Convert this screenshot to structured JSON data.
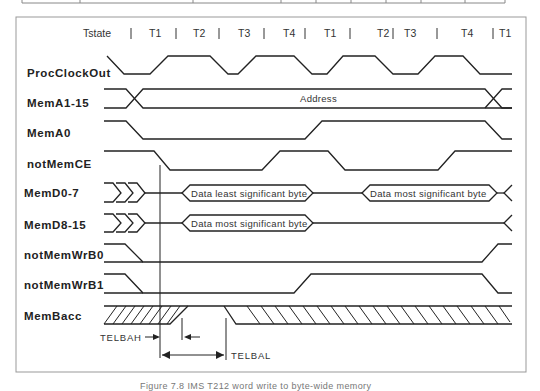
{
  "figure": {
    "caption": "Figure 7.8 IMS T212 word write to byte-wide memory"
  },
  "tstate": {
    "label": "Tstate",
    "states": [
      "T1",
      "T2",
      "T3",
      "T4",
      "T1",
      "T2",
      "T3",
      "T4",
      "T1"
    ]
  },
  "signals": [
    {
      "name": "ProcClockOut"
    },
    {
      "name": "MemA1-15",
      "bus_label": "Address"
    },
    {
      "name": "MemA0"
    },
    {
      "name": "notMemCE"
    },
    {
      "name": "MemD0-7",
      "bus_labels": [
        "Data least significant byte",
        "Data most significant byte"
      ]
    },
    {
      "name": "MemD8-15",
      "bus_labels": [
        "Data most significant byte"
      ]
    },
    {
      "name": "notMemWrB0"
    },
    {
      "name": "notMemWrB1"
    },
    {
      "name": "MemBacc"
    }
  ],
  "timing": {
    "telbah": "TELBAH",
    "telbal": "TELBAL"
  }
}
